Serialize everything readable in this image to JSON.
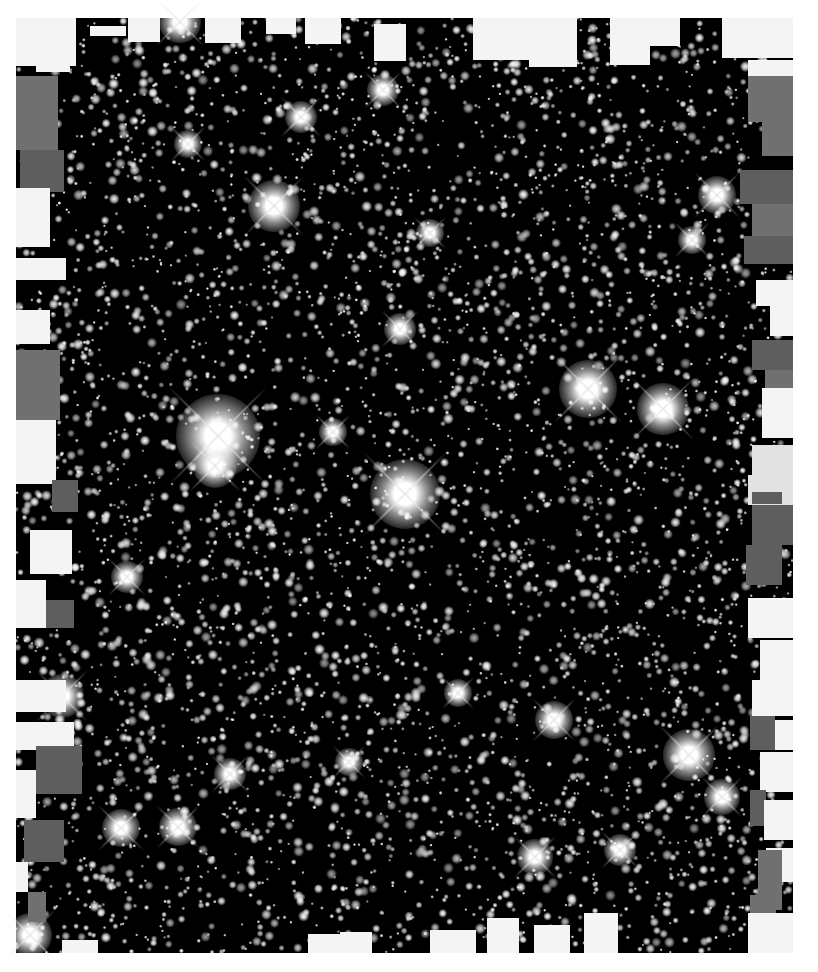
{
  "image": {
    "subject": "dense star field (globular cluster mosaic), grayscale",
    "width": 818,
    "height": 972,
    "colors": {
      "page_background": "#ffffff",
      "sky": "#000000",
      "star": "#ffffff",
      "mask_light": "#f4f4f4",
      "mask_gray_dark": "#5e5e5e",
      "mask_gray_mid": "#707070",
      "mask_gray_light": "#e2e2e2"
    }
  },
  "frame": {
    "x": 16,
    "y": 18,
    "w": 777,
    "h": 935
  },
  "field_stars": {
    "count": 5200,
    "seed": 1337,
    "radius_min": 0.9,
    "radius_max": 3.2,
    "brightness_min": 0.55,
    "brightness_max": 1.0
  },
  "bright_stars": [
    {
      "x": 218,
      "y": 436,
      "r": 26,
      "spike": 70
    },
    {
      "x": 405,
      "y": 494,
      "r": 22,
      "spike": 60
    },
    {
      "x": 215,
      "y": 466,
      "r": 14,
      "spike": 36
    },
    {
      "x": 588,
      "y": 389,
      "r": 18,
      "spike": 48
    },
    {
      "x": 663,
      "y": 409,
      "r": 16,
      "spike": 44
    },
    {
      "x": 274,
      "y": 206,
      "r": 16,
      "spike": 42
    },
    {
      "x": 689,
      "y": 755,
      "r": 16,
      "spike": 42
    },
    {
      "x": 180,
      "y": 22,
      "r": 13,
      "spike": 34
    },
    {
      "x": 717,
      "y": 195,
      "r": 12,
      "spike": 32
    },
    {
      "x": 554,
      "y": 720,
      "r": 12,
      "spike": 30
    },
    {
      "x": 62,
      "y": 696,
      "r": 14,
      "spike": 36
    },
    {
      "x": 30,
      "y": 935,
      "r": 14,
      "spike": 36
    },
    {
      "x": 121,
      "y": 828,
      "r": 12,
      "spike": 32
    },
    {
      "x": 178,
      "y": 827,
      "r": 12,
      "spike": 30
    },
    {
      "x": 301,
      "y": 117,
      "r": 10,
      "spike": 28
    },
    {
      "x": 383,
      "y": 90,
      "r": 10,
      "spike": 26
    },
    {
      "x": 535,
      "y": 857,
      "r": 11,
      "spike": 30
    },
    {
      "x": 620,
      "y": 850,
      "r": 10,
      "spike": 26
    },
    {
      "x": 400,
      "y": 329,
      "r": 10,
      "spike": 26
    },
    {
      "x": 333,
      "y": 432,
      "r": 9,
      "spike": 24
    },
    {
      "x": 230,
      "y": 774,
      "r": 10,
      "spike": 26
    },
    {
      "x": 722,
      "y": 797,
      "r": 11,
      "spike": 28
    },
    {
      "x": 127,
      "y": 577,
      "r": 10,
      "spike": 26
    },
    {
      "x": 188,
      "y": 144,
      "r": 9,
      "spike": 24
    },
    {
      "x": 692,
      "y": 240,
      "r": 9,
      "spike": 24
    },
    {
      "x": 430,
      "y": 233,
      "r": 9,
      "spike": 22
    },
    {
      "x": 349,
      "y": 762,
      "r": 9,
      "spike": 22
    },
    {
      "x": 458,
      "y": 693,
      "r": 9,
      "spike": 22
    }
  ],
  "edge_masks": [
    {
      "x": 16,
      "y": 18,
      "w": 60,
      "h": 48,
      "c": "mask_light"
    },
    {
      "x": 36,
      "y": 44,
      "w": 34,
      "h": 28,
      "c": "mask_light"
    },
    {
      "x": 90,
      "y": 26,
      "w": 36,
      "h": 10,
      "c": "mask_light"
    },
    {
      "x": 128,
      "y": 18,
      "w": 32,
      "h": 24,
      "c": "mask_light"
    },
    {
      "x": 205,
      "y": 18,
      "w": 36,
      "h": 25,
      "c": "mask_light"
    },
    {
      "x": 266,
      "y": 18,
      "w": 30,
      "h": 16,
      "c": "mask_light"
    },
    {
      "x": 305,
      "y": 18,
      "w": 36,
      "h": 26,
      "c": "mask_light"
    },
    {
      "x": 374,
      "y": 24,
      "w": 32,
      "h": 37,
      "c": "mask_light"
    },
    {
      "x": 473,
      "y": 18,
      "w": 56,
      "h": 42,
      "c": "mask_light"
    },
    {
      "x": 529,
      "y": 18,
      "w": 48,
      "h": 49,
      "c": "mask_light"
    },
    {
      "x": 610,
      "y": 18,
      "w": 40,
      "h": 47,
      "c": "mask_light"
    },
    {
      "x": 650,
      "y": 18,
      "w": 30,
      "h": 28,
      "c": "mask_light"
    },
    {
      "x": 722,
      "y": 18,
      "w": 71,
      "h": 40,
      "c": "mask_light"
    },
    {
      "x": 16,
      "y": 76,
      "w": 42,
      "h": 74,
      "c": "mask_gray_mid"
    },
    {
      "x": 20,
      "y": 150,
      "w": 44,
      "h": 42,
      "c": "mask_gray_dark"
    },
    {
      "x": 16,
      "y": 188,
      "w": 34,
      "h": 24,
      "c": "mask_light"
    },
    {
      "x": 16,
      "y": 205,
      "w": 34,
      "h": 42,
      "c": "mask_light"
    },
    {
      "x": 16,
      "y": 258,
      "w": 50,
      "h": 22,
      "c": "mask_light"
    },
    {
      "x": 16,
      "y": 310,
      "w": 34,
      "h": 34,
      "c": "mask_light"
    },
    {
      "x": 16,
      "y": 350,
      "w": 44,
      "h": 70,
      "c": "mask_gray_mid"
    },
    {
      "x": 16,
      "y": 420,
      "w": 40,
      "h": 64,
      "c": "mask_light"
    },
    {
      "x": 52,
      "y": 480,
      "w": 26,
      "h": 32,
      "c": "mask_gray_dark"
    },
    {
      "x": 30,
      "y": 530,
      "w": 42,
      "h": 44,
      "c": "mask_light"
    },
    {
      "x": 16,
      "y": 580,
      "w": 30,
      "h": 48,
      "c": "mask_light"
    },
    {
      "x": 46,
      "y": 600,
      "w": 28,
      "h": 28,
      "c": "mask_gray_dark"
    },
    {
      "x": 16,
      "y": 680,
      "w": 50,
      "h": 32,
      "c": "mask_light"
    },
    {
      "x": 16,
      "y": 722,
      "w": 58,
      "h": 28,
      "c": "mask_light"
    },
    {
      "x": 36,
      "y": 746,
      "w": 46,
      "h": 48,
      "c": "mask_gray_dark"
    },
    {
      "x": 16,
      "y": 770,
      "w": 20,
      "h": 48,
      "c": "mask_light"
    },
    {
      "x": 24,
      "y": 820,
      "w": 40,
      "h": 42,
      "c": "mask_gray_dark"
    },
    {
      "x": 16,
      "y": 862,
      "w": 12,
      "h": 30,
      "c": "mask_light"
    },
    {
      "x": 28,
      "y": 892,
      "w": 18,
      "h": 30,
      "c": "mask_gray_mid"
    },
    {
      "x": 62,
      "y": 940,
      "w": 36,
      "h": 13,
      "c": "mask_light"
    },
    {
      "x": 308,
      "y": 934,
      "w": 34,
      "h": 19,
      "c": "mask_light"
    },
    {
      "x": 340,
      "y": 932,
      "w": 32,
      "h": 21,
      "c": "mask_light"
    },
    {
      "x": 430,
      "y": 930,
      "w": 46,
      "h": 23,
      "c": "mask_light"
    },
    {
      "x": 487,
      "y": 918,
      "w": 32,
      "h": 35,
      "c": "mask_light"
    },
    {
      "x": 534,
      "y": 925,
      "w": 36,
      "h": 28,
      "c": "mask_light"
    },
    {
      "x": 584,
      "y": 913,
      "w": 34,
      "h": 40,
      "c": "mask_light"
    },
    {
      "x": 748,
      "y": 60,
      "w": 45,
      "h": 50,
      "c": "mask_light"
    },
    {
      "x": 748,
      "y": 76,
      "w": 45,
      "h": 46,
      "c": "mask_gray_mid"
    },
    {
      "x": 762,
      "y": 122,
      "w": 31,
      "h": 34,
      "c": "mask_gray_mid"
    },
    {
      "x": 740,
      "y": 170,
      "w": 53,
      "h": 34,
      "c": "mask_gray_dark"
    },
    {
      "x": 752,
      "y": 204,
      "w": 41,
      "h": 36,
      "c": "mask_gray_mid"
    },
    {
      "x": 744,
      "y": 236,
      "w": 49,
      "h": 28,
      "c": "mask_gray_dark"
    },
    {
      "x": 756,
      "y": 280,
      "w": 37,
      "h": 26,
      "c": "mask_light"
    },
    {
      "x": 770,
      "y": 306,
      "w": 23,
      "h": 30,
      "c": "mask_light"
    },
    {
      "x": 752,
      "y": 340,
      "w": 41,
      "h": 30,
      "c": "mask_gray_dark"
    },
    {
      "x": 765,
      "y": 370,
      "w": 28,
      "h": 20,
      "c": "mask_gray_mid"
    },
    {
      "x": 762,
      "y": 388,
      "w": 31,
      "h": 50,
      "c": "mask_light"
    },
    {
      "x": 752,
      "y": 445,
      "w": 41,
      "h": 30,
      "c": "mask_gray_light"
    },
    {
      "x": 748,
      "y": 475,
      "w": 45,
      "h": 30,
      "c": "mask_gray_light"
    },
    {
      "x": 752,
      "y": 492,
      "w": 30,
      "h": 12,
      "c": "mask_gray_dark"
    },
    {
      "x": 752,
      "y": 505,
      "w": 41,
      "h": 40,
      "c": "mask_gray_dark"
    },
    {
      "x": 746,
      "y": 545,
      "w": 36,
      "h": 40,
      "c": "mask_gray_dark"
    },
    {
      "x": 748,
      "y": 598,
      "w": 45,
      "h": 40,
      "c": "mask_light"
    },
    {
      "x": 760,
      "y": 640,
      "w": 33,
      "h": 40,
      "c": "mask_light"
    },
    {
      "x": 752,
      "y": 680,
      "w": 41,
      "h": 36,
      "c": "mask_light"
    },
    {
      "x": 750,
      "y": 716,
      "w": 25,
      "h": 34,
      "c": "mask_gray_dark"
    },
    {
      "x": 775,
      "y": 720,
      "w": 18,
      "h": 30,
      "c": "mask_light"
    },
    {
      "x": 760,
      "y": 752,
      "w": 33,
      "h": 40,
      "c": "mask_light"
    },
    {
      "x": 750,
      "y": 790,
      "w": 16,
      "h": 36,
      "c": "mask_gray_dark"
    },
    {
      "x": 764,
      "y": 800,
      "w": 29,
      "h": 40,
      "c": "mask_light"
    },
    {
      "x": 766,
      "y": 848,
      "w": 27,
      "h": 34,
      "c": "mask_light"
    },
    {
      "x": 758,
      "y": 850,
      "w": 24,
      "h": 60,
      "c": "mask_gray_mid"
    },
    {
      "x": 750,
      "y": 895,
      "w": 26,
      "h": 58,
      "c": "mask_gray_mid"
    },
    {
      "x": 748,
      "y": 913,
      "w": 45,
      "h": 40,
      "c": "mask_light"
    }
  ]
}
